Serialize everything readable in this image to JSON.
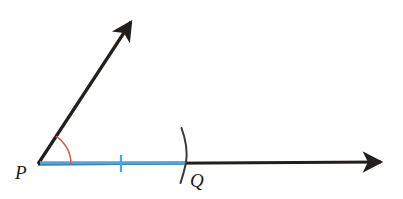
{
  "figure": {
    "type": "geometry-construction-diagram",
    "background_color": "#ffffff",
    "width": 403,
    "height": 199
  },
  "colors": {
    "ray_stroke": "#231f1c",
    "segment_highlight": "#4da6e0",
    "tick_mark": "#4da6e0",
    "angle_arc": "#c06a58",
    "construction_arc": "#3c3a38",
    "label_text": "#1a1a1a"
  },
  "points": {
    "vertex": {
      "label": "P",
      "x": 38,
      "y": 164,
      "label_x": 15,
      "label_y": 178
    },
    "marked": {
      "label": "Q",
      "x": 185,
      "y": 164,
      "label_x": 190,
      "label_y": 186
    }
  },
  "rays": [
    {
      "name": "upper-ray",
      "from_x": 38,
      "from_y": 164,
      "to_x": 137,
      "to_y": 13,
      "stroke_width": 3.2,
      "arrowhead": "end"
    },
    {
      "name": "horizontal-ray",
      "from_x": 38,
      "from_y": 164,
      "to_x": 388,
      "to_y": 162,
      "stroke_width": 3.2,
      "arrowhead": "end"
    }
  ],
  "highlighted_segment": {
    "name": "segment-PQ",
    "from_x": 40,
    "from_y": 163,
    "to_x": 186,
    "to_y": 163,
    "stroke_width": 3.4
  },
  "tick_mark": {
    "name": "congruence-tick",
    "x": 121,
    "y_top": 155,
    "y_bottom": 172,
    "stroke_width": 2.2
  },
  "angle_arc": {
    "name": "angle-arc-at-P",
    "center_x": 38,
    "center_y": 164,
    "radius": 33,
    "start_angle_deg": 0,
    "end_angle_deg": 56,
    "stroke_width": 1.6
  },
  "construction_arc": {
    "name": "construction-arc-at-Q",
    "path": "M 181 128 Q 189 156 185 164 Q 182 174 180 183",
    "stroke_width": 2.0
  },
  "labels": {
    "vertex_label": "P",
    "point_label": "Q"
  }
}
